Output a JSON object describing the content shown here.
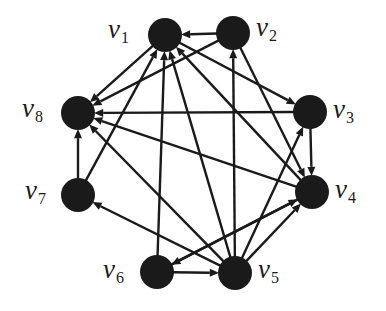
{
  "figure": {
    "type": "directed-graph",
    "title": "",
    "background_color": "#ffffff",
    "node_color": "#1a1a1a",
    "edge_color": "#1a1a1a",
    "node_radius": 17,
    "edge_width": 2.4,
    "arrow_size": 10,
    "canvas": {
      "width": 386,
      "height": 311
    }
  },
  "nodes": [
    {
      "id": "v1",
      "label": "v",
      "sub": "1",
      "cx": 165,
      "cy": 35,
      "label_x": 108,
      "label_y": 16,
      "label_name": "node-label-v1"
    },
    {
      "id": "v2",
      "label": "v",
      "sub": "2",
      "cx": 233,
      "cy": 33,
      "label_x": 256,
      "label_y": 14,
      "label_name": "node-label-v2"
    },
    {
      "id": "v3",
      "label": "v",
      "sub": "3",
      "cx": 310,
      "cy": 112,
      "label_x": 333,
      "label_y": 96,
      "label_name": "node-label-v3"
    },
    {
      "id": "v4",
      "label": "v",
      "sub": "4",
      "cx": 312,
      "cy": 192,
      "label_x": 335,
      "label_y": 176,
      "label_name": "node-label-v4"
    },
    {
      "id": "v5",
      "label": "v",
      "sub": "5",
      "cx": 235,
      "cy": 273,
      "label_x": 258,
      "label_y": 256,
      "label_name": "node-label-v5"
    },
    {
      "id": "v6",
      "label": "v",
      "sub": "6",
      "cx": 157,
      "cy": 272,
      "label_x": 103,
      "label_y": 256,
      "label_name": "node-label-v6"
    },
    {
      "id": "v7",
      "label": "v",
      "sub": "7",
      "cx": 78,
      "cy": 195,
      "label_x": 25,
      "label_y": 177,
      "label_name": "node-label-v7"
    },
    {
      "id": "v8",
      "label": "v",
      "sub": "8",
      "cx": 78,
      "cy": 113,
      "label_x": 22,
      "label_y": 95,
      "label_name": "node-label-v8"
    }
  ],
  "edges": [
    {
      "from": "v1",
      "to": "v8",
      "name": "edge-v1-v8"
    },
    {
      "from": "v1",
      "to": "v3",
      "name": "edge-v1-v3"
    },
    {
      "from": "v2",
      "to": "v1",
      "name": "edge-v2-v1"
    },
    {
      "from": "v2",
      "to": "v8",
      "name": "edge-v2-v8"
    },
    {
      "from": "v2",
      "to": "v4",
      "name": "edge-v2-v4"
    },
    {
      "from": "v3",
      "to": "v4",
      "name": "edge-v3-v4"
    },
    {
      "from": "v3",
      "to": "v8",
      "name": "edge-v3-v8"
    },
    {
      "from": "v4",
      "to": "v1",
      "name": "edge-v4-v1"
    },
    {
      "from": "v4",
      "to": "v8",
      "name": "edge-v4-v8"
    },
    {
      "from": "v4",
      "to": "v6",
      "name": "edge-v4-v6"
    },
    {
      "from": "v5",
      "to": "v1",
      "name": "edge-v5-v1"
    },
    {
      "from": "v5",
      "to": "v2",
      "name": "edge-v5-v2"
    },
    {
      "from": "v5",
      "to": "v3",
      "name": "edge-v5-v3"
    },
    {
      "from": "v5",
      "to": "v4",
      "name": "edge-v5-v4"
    },
    {
      "from": "v5",
      "to": "v7",
      "name": "edge-v5-v7"
    },
    {
      "from": "v5",
      "to": "v8",
      "name": "edge-v5-v8"
    },
    {
      "from": "v6",
      "to": "v1",
      "name": "edge-v6-v1"
    },
    {
      "from": "v6",
      "to": "v4",
      "name": "edge-v6-v4"
    },
    {
      "from": "v6",
      "to": "v5",
      "name": "edge-v6-v5"
    },
    {
      "from": "v7",
      "to": "v1",
      "name": "edge-v7-v1"
    },
    {
      "from": "v7",
      "to": "v8",
      "name": "edge-v7-v8"
    }
  ]
}
